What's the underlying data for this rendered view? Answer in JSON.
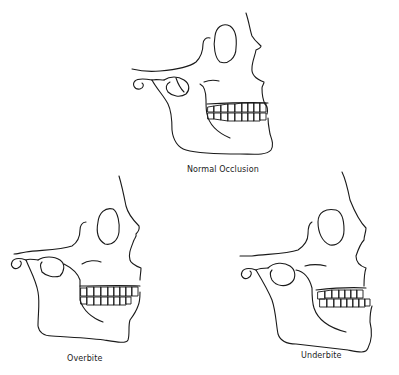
{
  "diagram": {
    "type": "lateral skull profile comparison",
    "line_color": "#1a1a1a",
    "background": "#ffffff",
    "panels": [
      {
        "id": "normal",
        "label": "Normal Occlusion",
        "position": "top-center"
      },
      {
        "id": "overbite",
        "label": "Overbite",
        "position": "bottom-left"
      },
      {
        "id": "underbite",
        "label": "Underbite",
        "position": "bottom-right"
      }
    ]
  }
}
